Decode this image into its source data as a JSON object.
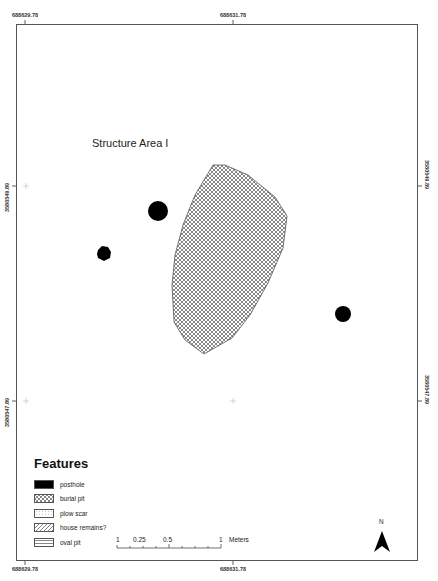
{
  "map": {
    "title": "Structure Area I",
    "coordinates": {
      "top_left": "688629.78",
      "top_center": "688631.78",
      "bottom_left": "688629.78",
      "bottom_center": "688631.78",
      "left_upper": "3580549.89",
      "left_lower": "3580547.89",
      "right_upper": "3580549.89",
      "right_lower": "3580547.89"
    },
    "features": [
      {
        "type": "posthole",
        "shape": "circle",
        "cx": 158,
        "cy": 211,
        "r": 10
      },
      {
        "type": "posthole",
        "shape": "circle",
        "cx": 104,
        "cy": 254,
        "r": 7
      },
      {
        "type": "posthole",
        "shape": "circle",
        "cx": 343,
        "cy": 314,
        "r": 8
      },
      {
        "type": "burial pit",
        "shape": "polygon",
        "points": "213,165 225,165 248,175 275,197 287,216 283,248 268,283 250,315 232,338 204,354 185,340 174,322 172,285 175,255 183,225 195,195"
      }
    ]
  },
  "legend": {
    "title": "Features",
    "items": [
      {
        "label": "posthole",
        "pattern": "solid-black"
      },
      {
        "label": "burial pit",
        "pattern": "crosshatch"
      },
      {
        "label": "plow scar",
        "pattern": "dotted"
      },
      {
        "label": "house remains?",
        "pattern": "diagonal"
      },
      {
        "label": "oval pit",
        "pattern": "horizontal"
      }
    ]
  },
  "scale_bar": {
    "labels": [
      "1",
      "0.25",
      "0.5",
      "1"
    ],
    "unit": "Meters"
  },
  "north_arrow": {
    "label": "N"
  },
  "colors": {
    "frame": "#555555",
    "fill_black": "#000000",
    "hatch": "#444444"
  }
}
